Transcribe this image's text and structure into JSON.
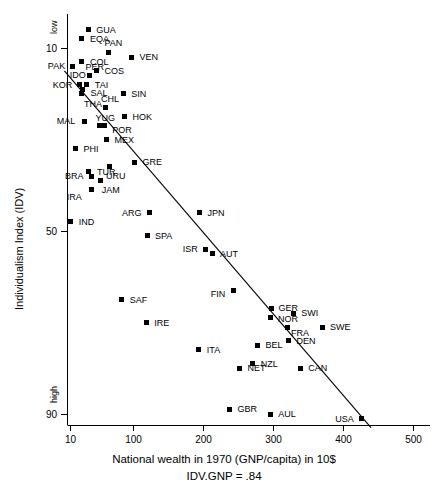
{
  "chart_data": {
    "type": "scatter",
    "title": "",
    "xlabel": "National wealth in 1970 (GNP/capita) in 10$",
    "sublabel": "IDV.GNP = .84",
    "ylabel": "Individualism Index (IDV)",
    "y_high_label": "low",
    "y_low_label": "high",
    "xlim": [
      0,
      530
    ],
    "ylim": [
      2,
      95
    ],
    "y_inverted": true,
    "grid": false,
    "legend": "none",
    "xticks": [
      10,
      100,
      200,
      300,
      400,
      500
    ],
    "xtick_labels": [
      "10",
      "100",
      "200",
      "300",
      "400",
      "500"
    ],
    "yticks": [
      10,
      50,
      90
    ],
    "ytick_labels": [
      "10",
      "50",
      "90"
    ],
    "trendline": {
      "label": "IDV.GNP = .84",
      "x_start": 2,
      "y_start": 15,
      "x_end": 440,
      "y_end": 93
    },
    "points": [
      {
        "label": "GUA",
        "x": 36,
        "y": 6,
        "lx": 8,
        "ly": -4
      },
      {
        "label": "EQA",
        "x": 27,
        "y": 8,
        "lx": 8,
        "ly": -4
      },
      {
        "label": "PAN",
        "x": 65,
        "y": 11,
        "lx": -4,
        "ly": -14
      },
      {
        "label": "PAK",
        "x": 14,
        "y": 14,
        "lx": -25,
        "ly": -4
      },
      {
        "label": "COL",
        "x": 27,
        "y": 13,
        "lx": 8,
        "ly": -4
      },
      {
        "label": "VEN",
        "x": 98,
        "y": 12,
        "lx": 8,
        "ly": -4
      },
      {
        "label": "IDO",
        "x": 14,
        "y": 14,
        "lx": -3,
        "ly": 5
      },
      {
        "label": "PER",
        "x": 38,
        "y": 16,
        "lx": -4,
        "ly": -12
      },
      {
        "label": "COS",
        "x": 48,
        "y": 15,
        "lx": 8,
        "ly": -4
      },
      {
        "label": "KOR",
        "x": 24,
        "y": 18,
        "lx": -27,
        "ly": -4
      },
      {
        "label": "TAI",
        "x": 34,
        "y": 18,
        "lx": 8,
        "ly": -4
      },
      {
        "label": "SAL",
        "x": 28,
        "y": 19,
        "lx": 8,
        "ly": 0
      },
      {
        "label": "THA",
        "x": 27,
        "y": 20,
        "lx": 2,
        "ly": 6
      },
      {
        "label": "CHL",
        "x": 60,
        "y": 23,
        "lx": -4,
        "ly": -12
      },
      {
        "label": "SIN",
        "x": 86,
        "y": 20,
        "lx": 8,
        "ly": -4
      },
      {
        "label": "HOK",
        "x": 88,
        "y": 25,
        "lx": 8,
        "ly": -4
      },
      {
        "label": "YUG",
        "x": 52,
        "y": 27,
        "lx": -4,
        "ly": -12
      },
      {
        "label": "POR",
        "x": 59,
        "y": 27,
        "lx": 8,
        "ly": 0
      },
      {
        "label": "MAL",
        "x": 31,
        "y": 26,
        "lx": -28,
        "ly": -4
      },
      {
        "label": "MEX",
        "x": 62,
        "y": 30,
        "lx": 8,
        "ly": -4
      },
      {
        "label": "PHI",
        "x": 18,
        "y": 32,
        "lx": 8,
        "ly": -4
      },
      {
        "label": "GRE",
        "x": 102,
        "y": 35,
        "lx": 8,
        "ly": -4
      },
      {
        "label": "TUR",
        "x": 37,
        "y": 37,
        "lx": 8,
        "ly": -4
      },
      {
        "label": "BRA",
        "x": 40,
        "y": 38,
        "lx": -26,
        "ly": -4
      },
      {
        "label": "URU",
        "x": 67,
        "y": 36,
        "lx": -4,
        "ly": 5
      },
      {
        "label": "JAM",
        "x": 54,
        "y": 39,
        "lx": 1,
        "ly": 5
      },
      {
        "label": "IRA",
        "x": 41,
        "y": 41,
        "lx": -25,
        "ly": 3
      },
      {
        "label": "ARG",
        "x": 123,
        "y": 46,
        "lx": -27,
        "ly": -4
      },
      {
        "label": "JPN",
        "x": 195,
        "y": 46,
        "lx": 8,
        "ly": -4
      },
      {
        "label": "IND",
        "x": 11,
        "y": 48,
        "lx": 8,
        "ly": -4
      },
      {
        "label": "SPA",
        "x": 120,
        "y": 51,
        "lx": 8,
        "ly": -4
      },
      {
        "label": "ISR",
        "x": 204,
        "y": 54,
        "lx": -23,
        "ly": -4
      },
      {
        "label": "AUT",
        "x": 213,
        "y": 55,
        "lx": 8,
        "ly": -4
      },
      {
        "label": "SAF",
        "x": 84,
        "y": 65,
        "lx": 8,
        "ly": -4
      },
      {
        "label": "FIN",
        "x": 244,
        "y": 63,
        "lx": -23,
        "ly": 0
      },
      {
        "label": "GER",
        "x": 298,
        "y": 67,
        "lx": 7,
        "ly": -5
      },
      {
        "label": "NOR",
        "x": 297,
        "y": 69,
        "lx": 7,
        "ly": -3
      },
      {
        "label": "SWI",
        "x": 329,
        "y": 68,
        "lx": 8,
        "ly": -4
      },
      {
        "label": "IRE",
        "x": 119,
        "y": 70,
        "lx": 8,
        "ly": -4
      },
      {
        "label": "FRA",
        "x": 320,
        "y": 71,
        "lx": 4,
        "ly": 2
      },
      {
        "label": "SWE",
        "x": 370,
        "y": 71,
        "lx": 8,
        "ly": -4
      },
      {
        "label": "BEL",
        "x": 278,
        "y": 75,
        "lx": 8,
        "ly": -4
      },
      {
        "label": "DEN",
        "x": 322,
        "y": 74,
        "lx": 8,
        "ly": -4
      },
      {
        "label": "ITA",
        "x": 194,
        "y": 76,
        "lx": 8,
        "ly": -4
      },
      {
        "label": "NZL",
        "x": 271,
        "y": 79,
        "lx": 8,
        "ly": -4
      },
      {
        "label": "NET",
        "x": 252,
        "y": 80,
        "lx": 8,
        "ly": -4
      },
      {
        "label": "CAN",
        "x": 339,
        "y": 80,
        "lx": 8,
        "ly": -4
      },
      {
        "label": "GBR",
        "x": 238,
        "y": 89,
        "lx": 8,
        "ly": -4
      },
      {
        "label": "AUL",
        "x": 296,
        "y": 90,
        "lx": 8,
        "ly": -4
      },
      {
        "label": "USA",
        "x": 426,
        "y": 91,
        "lx": -26,
        "ly": -4
      }
    ]
  }
}
